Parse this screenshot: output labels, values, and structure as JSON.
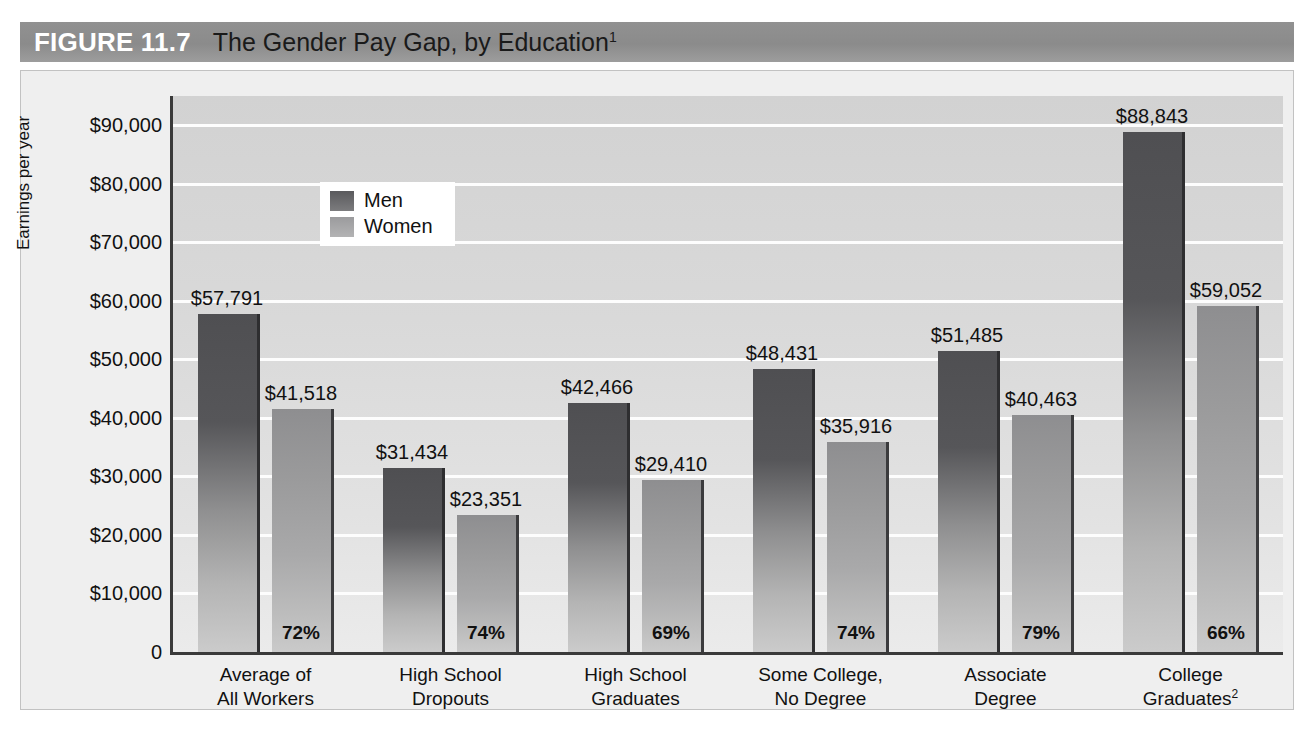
{
  "header": {
    "figure_number": "FIGURE 11.7",
    "title": "The Gender Pay Gap, by Education",
    "title_superscript": "1"
  },
  "legend": {
    "men_label": "Men",
    "women_label": "Women",
    "men_color": "#58585a",
    "women_color": "#9b9b9d"
  },
  "chart_data": {
    "type": "bar",
    "title": "The Gender Pay Gap, by Education",
    "xlabel": "",
    "ylabel": "Earnings per year",
    "ylim": [
      0,
      95000
    ],
    "ytick_values": [
      0,
      10000,
      20000,
      30000,
      40000,
      50000,
      60000,
      70000,
      80000,
      90000
    ],
    "ytick_labels": [
      "0",
      "$10,000",
      "$20,000",
      "$30,000",
      "$40,000",
      "$50,000",
      "$60,000",
      "$70,000",
      "$80,000",
      "$90,000"
    ],
    "grid": true,
    "legend_position": "upper-left-inside",
    "categories": [
      "Average of\nAll Workers",
      "High School\nDropouts",
      "High School\nGraduates",
      "Some College,\nNo Degree",
      "Associate\nDegree",
      "College\nGraduates"
    ],
    "category_lines": [
      [
        "Average of",
        "All Workers"
      ],
      [
        "High School",
        "Dropouts"
      ],
      [
        "High School",
        "Graduates"
      ],
      [
        "Some College,",
        "No Degree"
      ],
      [
        "Associate",
        "Degree"
      ],
      [
        "College",
        "Graduates"
      ]
    ],
    "category_superscripts": [
      "",
      "",
      "",
      "",
      "",
      "2"
    ],
    "series": [
      {
        "name": "Men",
        "values": [
          57791,
          31434,
          42466,
          48431,
          51485,
          88843
        ],
        "labels": [
          "$57,791",
          "$31,434",
          "$42,466",
          "$48,431",
          "$51,485",
          "$88,843"
        ]
      },
      {
        "name": "Women",
        "values": [
          41518,
          23351,
          29410,
          35916,
          40463,
          59052
        ],
        "labels": [
          "$41,518",
          "$23,351",
          "$29,410",
          "$35,916",
          "$40,463",
          "$59,052"
        ]
      }
    ],
    "ratio_labels": [
      "72%",
      "74%",
      "69%",
      "74%",
      "79%",
      "66%"
    ]
  }
}
